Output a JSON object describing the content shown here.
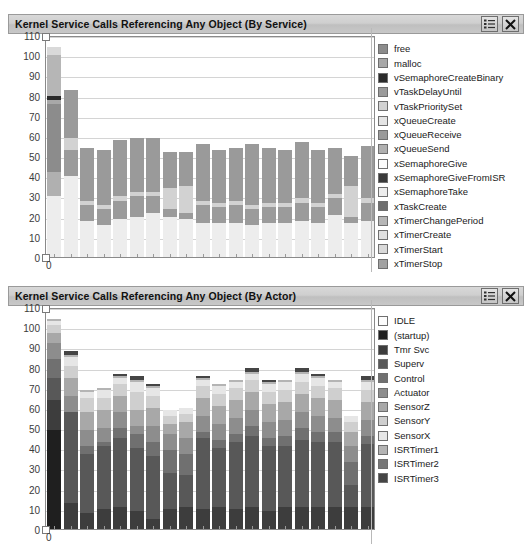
{
  "panels": [
    {
      "id": "service",
      "title": "Kernel Service Calls Referencing Any Object (By Service)",
      "buttons": {
        "legend_toggle": "legend-toggle",
        "close": "close"
      },
      "chart_data": {
        "type": "bar",
        "stacked": true,
        "title": "Kernel Service Calls Referencing Any Object (By Service)",
        "xlabel": "",
        "ylabel": "",
        "ylim": [
          0,
          110
        ],
        "ytick_step": 10,
        "yticks": [
          110,
          100,
          90,
          80,
          70,
          60,
          50,
          40,
          30,
          20,
          10,
          0
        ],
        "xtick_labels": [
          "0"
        ],
        "grid": true,
        "legend_position": "right",
        "categories": [
          "0",
          "1",
          "2",
          "3",
          "4",
          "5",
          "6",
          "7",
          "8",
          "9",
          "10",
          "11",
          "12",
          "13",
          "14",
          "15",
          "16",
          "17",
          "18",
          "19"
        ],
        "series": [
          {
            "name": "free",
            "color": "#8c8c8c",
            "values": [
              34,
              0,
              0,
              0,
              0,
              0,
              0,
              0,
              0,
              0,
              0,
              0,
              0,
              0,
              0,
              0,
              0,
              0,
              0,
              0
            ]
          },
          {
            "name": "malloc",
            "color": "#a8a8a8",
            "values": [
              2,
              0,
              0,
              0,
              0,
              0,
              0,
              0,
              0,
              0,
              0,
              0,
              0,
              0,
              0,
              0,
              0,
              0,
              0,
              0
            ]
          },
          {
            "name": "vSemaphoreCreateBinary",
            "color": "#2b2b2b",
            "values": [
              2,
              0,
              0,
              0,
              0,
              0,
              0,
              0,
              0,
              0,
              0,
              0,
              0,
              0,
              0,
              0,
              0,
              0,
              0,
              0
            ]
          },
          {
            "name": "vTaskDelayUntil",
            "color": "#9b9b9b",
            "values": [
              0,
              13,
              8,
              8,
              9,
              10,
              8,
              4,
              3,
              9,
              8,
              9,
              8,
              8,
              8,
              9,
              8,
              8,
              3,
              9
            ]
          },
          {
            "name": "vTaskPrioritySet",
            "color": "#d2d2d2",
            "values": [
              0,
              6,
              2,
              2,
              2,
              2,
              2,
              10,
              13,
              2,
              2,
              2,
              2,
              2,
              2,
              2,
              2,
              2,
              15,
              2
            ]
          },
          {
            "name": "xQueueCreate",
            "color": "#e4e4e4",
            "values": [
              0,
              0,
              0,
              0,
              0,
              0,
              0,
              0,
              0,
              0,
              0,
              0,
              0,
              0,
              0,
              0,
              0,
              0,
              0,
              0
            ]
          },
          {
            "name": "xQueueReceive",
            "color": "#9a9a9a",
            "values": [
              0,
              24,
              26,
              27,
              28,
              27,
              27,
              18,
              17,
              28,
              26,
              26,
              30,
              27,
              26,
              28,
              26,
              23,
              15,
              26
            ]
          },
          {
            "name": "xQueueSend",
            "color": "#b0b0b0",
            "values": [
              12,
              0,
              0,
              0,
              0,
              0,
              0,
              0,
              0,
              0,
              0,
              0,
              0,
              0,
              0,
              0,
              0,
              0,
              0,
              0
            ]
          },
          {
            "name": "xSemaphoreGive",
            "color": "#fbfbfb",
            "values": [
              0,
              0,
              0,
              0,
              0,
              0,
              0,
              0,
              0,
              0,
              0,
              0,
              0,
              0,
              0,
              0,
              0,
              0,
              0,
              0
            ]
          },
          {
            "name": "xSemaphoreGiveFromISR",
            "color": "#3a3a3a",
            "values": [
              0,
              0,
              0,
              0,
              0,
              0,
              0,
              0,
              0,
              0,
              0,
              0,
              0,
              0,
              0,
              0,
              0,
              0,
              0,
              0
            ]
          },
          {
            "name": "xSemaphoreTake",
            "color": "#ededed",
            "values": [
              30,
              40,
              18,
              16,
              19,
              20,
              22,
              20,
              19,
              17,
              17,
              17,
              16,
              17,
              17,
              18,
              17,
              21,
              17,
              18
            ]
          },
          {
            "name": "xTaskCreate",
            "color": "#6e6e6e",
            "values": [
              0,
              0,
              0,
              0,
              0,
              0,
              0,
              0,
              0,
              0,
              0,
              0,
              0,
              0,
              0,
              0,
              0,
              0,
              0,
              0
            ]
          },
          {
            "name": "xTimerChangePeriod",
            "color": "#b6b6b6",
            "values": [
              20,
              0,
              0,
              0,
              0,
              0,
              0,
              0,
              0,
              0,
              0,
              0,
              0,
              0,
              0,
              0,
              0,
              0,
              0,
              0
            ]
          },
          {
            "name": "xTimerCreate",
            "color": "#e0e0e0",
            "values": [
              0,
              0,
              0,
              0,
              0,
              0,
              0,
              0,
              0,
              0,
              0,
              0,
              0,
              0,
              0,
              0,
              0,
              0,
              0,
              0
            ]
          },
          {
            "name": "xTimerStart",
            "color": "#d9d9d9",
            "values": [
              4,
              0,
              0,
              0,
              0,
              0,
              0,
              0,
              0,
              0,
              0,
              0,
              0,
              0,
              0,
              0,
              0,
              0,
              0,
              0
            ]
          },
          {
            "name": "xTimerStop",
            "color": "#a2a2a2",
            "values": [
              0,
              0,
              0,
              0,
              0,
              0,
              0,
              0,
              0,
              0,
              0,
              0,
              0,
              0,
              0,
              0,
              0,
              0,
              0,
              0
            ]
          }
        ],
        "stack_order_bottom_to_top": [
          "xSemaphoreTake",
          "vTaskDelayUntil",
          "vTaskPrioritySet",
          "xQueueReceive",
          "xQueueSend",
          "free",
          "malloc",
          "vSemaphoreCreateBinary",
          "xTimerChangePeriod",
          "xTimerStart"
        ],
        "bar_totals": [
          104,
          83,
          54,
          53,
          58,
          59,
          59,
          52,
          52,
          56,
          53,
          54,
          56,
          54,
          53,
          57,
          53,
          54,
          50,
          55
        ]
      },
      "legend": [
        {
          "label": "free",
          "color": "#8c8c8c"
        },
        {
          "label": "malloc",
          "color": "#a8a8a8"
        },
        {
          "label": "vSemaphoreCreateBinary",
          "color": "#2b2b2b"
        },
        {
          "label": "vTaskDelayUntil",
          "color": "#9b9b9b"
        },
        {
          "label": "vTaskPrioritySet",
          "color": "#d2d2d2"
        },
        {
          "label": "xQueueCreate",
          "color": "#e4e4e4"
        },
        {
          "label": "xQueueReceive",
          "color": "#9a9a9a"
        },
        {
          "label": "xQueueSend",
          "color": "#b0b0b0"
        },
        {
          "label": "xSemaphoreGive",
          "color": "#fbfbfb"
        },
        {
          "label": "xSemaphoreGiveFromISR",
          "color": "#3a3a3a"
        },
        {
          "label": "xSemaphoreTake",
          "color": "#ededed"
        },
        {
          "label": "xTaskCreate",
          "color": "#6e6e6e"
        },
        {
          "label": "xTimerChangePeriod",
          "color": "#b6b6b6"
        },
        {
          "label": "xTimerCreate",
          "color": "#e0e0e0"
        },
        {
          "label": "xTimerStart",
          "color": "#d9d9d9"
        },
        {
          "label": "xTimerStop",
          "color": "#a2a2a2"
        }
      ]
    },
    {
      "id": "actor",
      "title": "Kernel Service Calls Referencing Any Object (By Actor)",
      "buttons": {
        "legend_toggle": "legend-toggle",
        "close": "close"
      },
      "chart_data": {
        "type": "bar",
        "stacked": true,
        "title": "Kernel Service Calls Referencing Any Object (By Actor)",
        "xlabel": "",
        "ylabel": "",
        "ylim": [
          0,
          110
        ],
        "ytick_step": 10,
        "yticks": [
          110,
          100,
          90,
          80,
          70,
          60,
          50,
          40,
          30,
          20,
          10,
          0
        ],
        "xtick_labels": [
          "0"
        ],
        "grid": true,
        "legend_position": "right",
        "categories": [
          "0",
          "1",
          "2",
          "3",
          "4",
          "5",
          "6",
          "7",
          "8",
          "9",
          "10",
          "11",
          "12",
          "13",
          "14",
          "15",
          "16",
          "17",
          "18",
          "19"
        ],
        "series": [
          {
            "name": "IDLE",
            "color": "#fcfcfc",
            "values": [
              0,
              0,
              0,
              0,
              0,
              0,
              0,
              0,
              0,
              0,
              0,
              0,
              0,
              0,
              0,
              0,
              0,
              0,
              0,
              0
            ]
          },
          {
            "name": "(startup)",
            "color": "#1f1f1f",
            "values": [
              49,
              0,
              0,
              0,
              0,
              0,
              0,
              0,
              0,
              0,
              0,
              0,
              0,
              0,
              0,
              0,
              0,
              0,
              0,
              0
            ]
          },
          {
            "name": "Tmr Svc",
            "color": "#3d3d3d",
            "values": [
              15,
              13,
              8,
              10,
              11,
              9,
              5,
              10,
              11,
              10,
              11,
              10,
              11,
              9,
              11,
              11,
              11,
              11,
              11,
              11
            ]
          },
          {
            "name": "Superv",
            "color": "#585858",
            "values": [
              11,
              45,
              29,
              31,
              34,
              31,
              31,
              18,
              16,
              35,
              29,
              33,
              35,
              32,
              30,
              33,
              32,
              32,
              11,
              31
            ]
          },
          {
            "name": "Control",
            "color": "#707070",
            "values": [
              9,
              0,
              4,
              2,
              5,
              7,
              7,
              11,
              10,
              3,
              4,
              4,
              5,
              4,
              5,
              6,
              5,
              5,
              11,
              4
            ]
          },
          {
            "name": "Actuator",
            "color": "#8d8d8d",
            "values": [
              8,
              8,
              8,
              7,
              8,
              4,
              8,
              8,
              8,
              8,
              8,
              8,
              8,
              8,
              8,
              8,
              8,
              7,
              8,
              8
            ]
          },
          {
            "name": "SensorZ",
            "color": "#a8a8a8",
            "values": [
              5,
              9,
              9,
              9,
              8,
              8,
              9,
              5,
              8,
              9,
              9,
              9,
              9,
              9,
              9,
              9,
              9,
              9,
              7,
              9
            ]
          },
          {
            "name": "SensorY",
            "color": "#cfcfcf",
            "values": [
              4,
              6,
              7,
              6,
              6,
              9,
              6,
              4,
              4,
              6,
              6,
              6,
              6,
              6,
              6,
              6,
              6,
              6,
              5,
              6
            ]
          },
          {
            "name": "SensorX",
            "color": "#e6e6e6",
            "values": [
              2,
              4,
              3,
              4,
              3,
              5,
              4,
              3,
              3,
              3,
              4,
              3,
              3,
              4,
              4,
              4,
              4,
              3,
              3,
              4
            ]
          },
          {
            "name": "ISRTimer1",
            "color": "#b4b4b4",
            "values": [
              1,
              1,
              1,
              1,
              1,
              1,
              1,
              0,
              0,
              1,
              1,
              1,
              1,
              1,
              1,
              1,
              1,
              1,
              0,
              1
            ]
          },
          {
            "name": "ISRTimer2",
            "color": "#777777",
            "values": [
              0,
              0,
              0,
              0,
              0,
              0,
              0,
              0,
              0,
              0,
              0,
              0,
              0,
              0,
              0,
              0,
              0,
              0,
              0,
              0
            ]
          },
          {
            "name": "ISRTimer3",
            "color": "#454545",
            "values": [
              0,
              2,
              0,
              0,
              1,
              2,
              1,
              0,
              0,
              1,
              0,
              0,
              2,
              1,
              0,
              2,
              1,
              0,
              0,
              2
            ]
          }
        ],
        "stack_order_bottom_to_top": [
          "(startup)",
          "Tmr Svc",
          "Superv",
          "Control",
          "Actuator",
          "SensorZ",
          "SensorY",
          "SensorX",
          "ISRTimer1",
          "ISRTimer3"
        ],
        "bar_totals": [
          104,
          88,
          69,
          70,
          76,
          78,
          71,
          59,
          61,
          76,
          72,
          74,
          79,
          74,
          72,
          77,
          76,
          74,
          56,
          76
        ]
      },
      "legend": [
        {
          "label": "IDLE",
          "color": "#fcfcfc"
        },
        {
          "label": "(startup)",
          "color": "#1f1f1f"
        },
        {
          "label": "Tmr Svc",
          "color": "#3d3d3d"
        },
        {
          "label": "Superv",
          "color": "#585858"
        },
        {
          "label": "Control",
          "color": "#707070"
        },
        {
          "label": "Actuator",
          "color": "#8d8d8d"
        },
        {
          "label": "SensorZ",
          "color": "#a8a8a8"
        },
        {
          "label": "SensorY",
          "color": "#cfcfcf"
        },
        {
          "label": "SensorX",
          "color": "#e6e6e6"
        },
        {
          "label": "ISRTimer1",
          "color": "#b4b4b4"
        },
        {
          "label": "ISRTimer2",
          "color": "#777777"
        },
        {
          "label": "ISRTimer3",
          "color": "#454545"
        }
      ]
    }
  ]
}
